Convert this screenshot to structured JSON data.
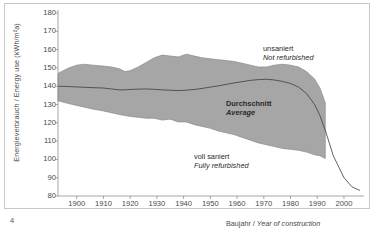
{
  "figure": {
    "page_number": "4",
    "axis_titles": {
      "y": "Energieverbrauch / Energy use (kWh/m²a)",
      "x_de": "Baujahr",
      "x_sep": " / ",
      "x_en": "Year of construction"
    },
    "annotations": {
      "upper_de": "unsaniert",
      "upper_en": "Not refurbished",
      "middle_de": "Durchschnitt",
      "middle_en": "Average",
      "lower_de": "voll saniert",
      "lower_en": "Fully refurbished"
    },
    "colors": {
      "band_fill": "#a6a6a6",
      "band_stroke": "#8a8a8a",
      "average_line": "#3c3c3c",
      "axis": "#8f8f8f",
      "frame": "#c9c9c9",
      "text": "#3a3a3a",
      "background": "#ffffff"
    }
  },
  "chart_data": {
    "type": "area",
    "title": "",
    "xlabel": "Baujahr / Year of construction",
    "ylabel": "Energieverbrauch / Energy use (kWh/m²a)",
    "xlim": [
      1893,
      2006
    ],
    "ylim": [
      80,
      180
    ],
    "xticks": [
      1900,
      1910,
      1920,
      1930,
      1940,
      1950,
      1960,
      1970,
      1980,
      1990,
      2000
    ],
    "yticks": [
      80,
      90,
      100,
      110,
      120,
      130,
      140,
      150,
      160,
      170,
      180
    ],
    "grid": false,
    "legend_position": "inline-annotations",
    "x": [
      1893,
      1897,
      1900,
      1903,
      1906,
      1910,
      1913,
      1916,
      1918,
      1920,
      1923,
      1926,
      1929,
      1932,
      1935,
      1938,
      1941,
      1944,
      1947,
      1950,
      1953,
      1956,
      1959,
      1962,
      1965,
      1968,
      1971,
      1974,
      1977,
      1980,
      1983,
      1986,
      1989,
      1991,
      1993,
      1996,
      2000,
      2003,
      2006
    ],
    "series": [
      {
        "name": "unsaniert / Not refurbished",
        "role": "band-upper",
        "values": [
          147,
          150,
          151.5,
          152,
          151.5,
          151,
          150.5,
          149.5,
          148,
          148.5,
          150.5,
          153,
          155.5,
          157,
          156.5,
          156,
          157.5,
          156.5,
          155.5,
          155,
          154.5,
          154,
          153.5,
          152.5,
          151.5,
          150.5,
          150.5,
          151.5,
          152,
          151.5,
          150.5,
          148,
          144,
          139,
          131,
          null,
          null,
          null,
          null
        ]
      },
      {
        "name": "Durchschnitt / Average",
        "role": "center-line",
        "values": [
          140,
          139.8,
          139.6,
          139.4,
          139.2,
          139,
          138.5,
          138,
          138,
          138.2,
          138.4,
          138.5,
          138.3,
          138,
          137.8,
          137.6,
          137.8,
          138.2,
          138.8,
          139.5,
          140.2,
          141,
          141.8,
          142.5,
          143.2,
          143.6,
          143.8,
          143.4,
          142.6,
          141.5,
          139.5,
          136,
          130,
          124,
          116,
          102,
          90,
          85,
          83
        ]
      },
      {
        "name": "voll saniert / Fully refurbished",
        "role": "band-lower",
        "values": [
          132,
          130.5,
          129.5,
          128.5,
          127.5,
          126.5,
          125.5,
          124.5,
          124,
          123.5,
          123,
          122.5,
          122.5,
          121.5,
          122,
          120.5,
          120.5,
          119,
          118,
          117,
          115.5,
          114.5,
          113.5,
          112,
          110.5,
          109,
          108,
          107,
          106,
          105.5,
          105,
          104,
          102.5,
          102,
          100.5,
          null,
          null,
          null,
          null
        ]
      }
    ]
  }
}
